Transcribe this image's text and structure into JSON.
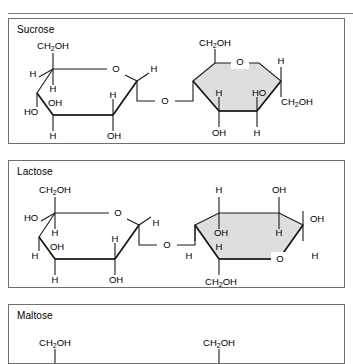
{
  "figure": {
    "kind": "disaccharide-structures",
    "panels": [
      {
        "id": "sucrose",
        "title": "Sucrose",
        "linkage_label": "O",
        "rings": [
          {
            "id": "sucrose-glucose",
            "shape": "hexagon",
            "shaded": false,
            "labels": [
              "CH2OH",
              "O",
              "H",
              "H",
              "OH",
              "HO",
              "H",
              "OH",
              "H",
              "H"
            ],
            "label_list": {
              "top_ch2oh": "CH2OH",
              "ring_oxygen": "O",
              "upper_left_h": "H",
              "inner_h": "H",
              "inner_oh": "OH",
              "left_ho": "HO",
              "bottom_left_h": "H",
              "bottom_right_oh": "OH",
              "inner_right_h": "H",
              "upper_right_h": "H"
            }
          },
          {
            "id": "sucrose-fructose",
            "shape": "pentagon",
            "shaded": true,
            "label_list": {
              "top_left_ch2oh": "CH2OH",
              "ring_oxygen": "O",
              "upper_right_h": "H",
              "inner_left_h": "H",
              "inner_right_ho": "HO",
              "right_ch2oh": "CH2OH",
              "bottom_left_oh": "OH",
              "bottom_right_h": "H"
            }
          }
        ]
      },
      {
        "id": "lactose",
        "title": "Lactose",
        "linkage_label": "O",
        "rings": [
          {
            "id": "lactose-galactose",
            "shape": "hexagon",
            "shaded": false,
            "label_list": {
              "top_ch2oh": "CH2OH",
              "ring_oxygen": "O",
              "upper_left_ho": "HO",
              "inner_h": "H",
              "inner_oh": "OH",
              "lower_left_h": "H",
              "bottom_left_h": "H",
              "bottom_right_oh": "OH",
              "inner_right_h": "H",
              "right_h": "H"
            }
          },
          {
            "id": "lactose-glucose",
            "shape": "hexagon",
            "shaded": true,
            "label_list": {
              "top_left_h": "H",
              "top_right_oh": "OH",
              "right_oh": "OH",
              "inner_oh": "OH",
              "inner_h_left": "H",
              "inner_h_right": "H",
              "left_h": "H",
              "ring_oxygen": "O",
              "bottom_right_h": "H",
              "bottom_ch2oh": "CH2OH"
            }
          }
        ]
      },
      {
        "id": "maltose",
        "title": "Maltose",
        "clipped": true,
        "rings": [
          {
            "id": "maltose-glucose-1",
            "label_list": {
              "top_ch2oh": "CH2OH"
            }
          },
          {
            "id": "maltose-glucose-2",
            "label_list": {
              "top_ch2oh": "CH2OH"
            }
          }
        ]
      }
    ]
  },
  "colors": {
    "ink": "#000000",
    "panel_border": "#6f6f6f",
    "bond": "#1a1a1a",
    "ring_shaded": "#dedede",
    "ring_plain": "#ffffff",
    "page": "#ffffff"
  }
}
